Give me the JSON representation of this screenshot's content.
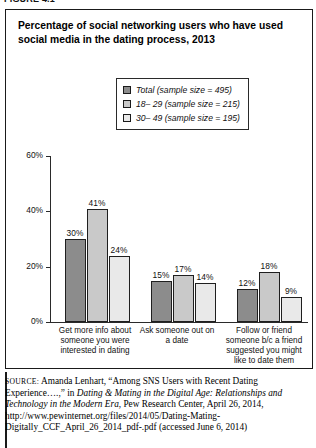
{
  "header": {
    "cut_off_text": "FIGURE 4.1"
  },
  "figure": {
    "title": "Percentage of social networking users who have used social media in the dating process, 2013"
  },
  "legend": {
    "position": "inside-top-center",
    "items": [
      {
        "label": "Total (sample size = 495)",
        "color": "#8c8c8c"
      },
      {
        "label": "18– 29 (sample size = 215)",
        "color": "#c9c9c9"
      },
      {
        "label": "30– 49 (sample size = 195)",
        "color": "#e9e9e9"
      }
    ]
  },
  "chart_data": {
    "type": "bar",
    "title": "Percentage of social networking users who have used social media in the dating process, 2013",
    "xlabel": "",
    "ylabel": "",
    "ylim": [
      0,
      60
    ],
    "grid": false,
    "legend_position": "inside-top-center",
    "ytick_labels": [
      "0%",
      "20%",
      "40%",
      "60%"
    ],
    "ytick_values": [
      0,
      20,
      40,
      60
    ],
    "categories": [
      "Get more info about someone you were interested in dating",
      "Ask someone out on a date",
      "Follow or friend someone b/c a friend suggested you might like to date them"
    ],
    "series": [
      {
        "name": "Total (sample size = 495)",
        "color": "#8c8c8c",
        "values": [
          30,
          15,
          12
        ],
        "labels": [
          "30%",
          "15%",
          "12%"
        ]
      },
      {
        "name": "18– 29 (sample size = 215)",
        "color": "#c9c9c9",
        "values": [
          41,
          17,
          18
        ],
        "labels": [
          "41%",
          "17%",
          "18%"
        ]
      },
      {
        "name": "30– 49 (sample size = 195)",
        "color": "#e9e9e9",
        "values": [
          24,
          14,
          9
        ],
        "labels": [
          "24%",
          "14%",
          "9%"
        ]
      }
    ]
  },
  "source": {
    "label": "SOURCE:",
    "part1": " Amanda Lenhart, “Among SNS Users with Recent Dating Experience….,” in ",
    "italic1": "Dating & Mating in the Digital Age: Relationships and Technology in the Modern Era",
    "part2": ", Pew Research Center, April 26, 2014, http://www.pewinternet.org/files/2014/05/Dating-Mating-Digitally_CCF_April_26_2014_pdf-.pdf (accessed June 6, 2014)"
  }
}
